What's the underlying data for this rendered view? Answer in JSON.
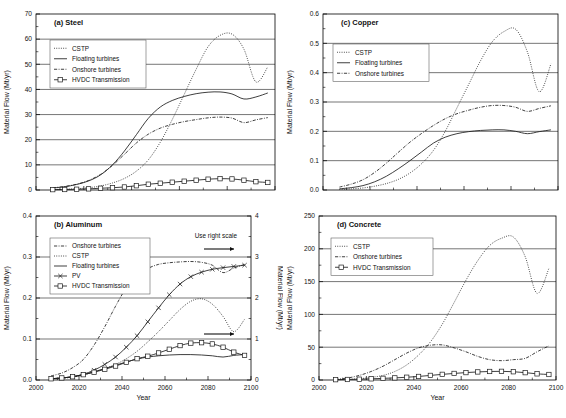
{
  "figure": {
    "width": 566,
    "height": 418,
    "background": "#ffffff",
    "line_color": "#1c1c1c",
    "grid_color": "#3b3b3b"
  },
  "chart_data": [
    {
      "id": "panel-a",
      "type": "line",
      "title": "(a)  Steel",
      "panel_letter": "(a)",
      "panel_name": "Steel",
      "xlabel": "",
      "ylabel": "Material Flow (Mt/yr)",
      "xlim": [
        2000,
        2100
      ],
      "ylim": [
        0,
        70
      ],
      "xticks": [
        2000,
        2020,
        2040,
        2060,
        2080,
        2100
      ],
      "yticks": [
        0,
        10,
        20,
        30,
        40,
        50,
        60,
        70
      ],
      "ytick_labels": [
        "0",
        "10",
        "20",
        "30",
        "40",
        "50",
        "60",
        "70"
      ],
      "xtick_labels": [
        "",
        "",
        "",
        "",
        "",
        ""
      ],
      "grid": "horizontal",
      "legend_position": "upper-left",
      "x": [
        2007,
        2012,
        2017,
        2022,
        2027,
        2032,
        2037,
        2042,
        2047,
        2052,
        2057,
        2062,
        2067,
        2072,
        2077,
        2082,
        2087,
        2092,
        2097
      ],
      "series": [
        {
          "name": "CSTP",
          "style": "dotted",
          "marker": "none",
          "values": [
            0.2,
            0.3,
            0.5,
            0.9,
            1.6,
            2.8,
            4.6,
            7.5,
            12.0,
            19.0,
            28.0,
            38.0,
            48.0,
            57.0,
            61.5,
            62.0,
            56.0,
            43.0,
            49.0
          ]
        },
        {
          "name": "Floating turbines",
          "style": "solid",
          "marker": "none",
          "values": [
            0.8,
            1.3,
            2.2,
            3.6,
            6.0,
            10.0,
            15.5,
            22.0,
            28.5,
            33.0,
            35.6,
            37.2,
            38.3,
            38.9,
            39.0,
            38.2,
            36.2,
            37.0,
            38.6
          ]
        },
        {
          "name": "Onshore turbines",
          "style": "dash-dot",
          "marker": "none",
          "values": [
            0.9,
            1.4,
            2.3,
            3.8,
            6.2,
            9.8,
            14.2,
            18.7,
            22.2,
            24.6,
            26.1,
            27.2,
            28.0,
            28.7,
            29.0,
            28.6,
            26.8,
            27.9,
            28.8
          ]
        },
        {
          "name": "HVDC Transmission",
          "style": "solid-marker",
          "marker": "square",
          "values": [
            0.15,
            0.2,
            0.3,
            0.45,
            0.7,
            0.9,
            1.2,
            1.7,
            2.3,
            2.7,
            3.1,
            3.5,
            3.9,
            4.3,
            4.5,
            4.4,
            3.9,
            3.3,
            3.0
          ]
        }
      ]
    },
    {
      "id": "panel-b",
      "type": "line",
      "title": "(b)  Aluminum",
      "panel_letter": "(b)",
      "panel_name": "Aluminum",
      "xlabel": "Year",
      "ylabel": "Material Flow (Mt/yr)",
      "ylabel_right": "Material Flow (Mt/yr)",
      "xlim": [
        2000,
        2100
      ],
      "ylim": [
        0.0,
        0.4
      ],
      "ylim_right": [
        0,
        4
      ],
      "xticks": [
        2000,
        2020,
        2040,
        2060,
        2080,
        2100
      ],
      "xtick_labels": [
        "2000",
        "2020",
        "2040",
        "2060",
        "2080",
        "2100"
      ],
      "yticks": [
        0.0,
        0.1,
        0.2,
        0.3,
        0.4
      ],
      "ytick_labels": [
        "0.0",
        "0.1",
        "0.2",
        "0.3",
        "0.4"
      ],
      "yticks_right": [
        0,
        1,
        2,
        3,
        4
      ],
      "ytick_labels_right": [
        "0",
        "1",
        "2",
        "3",
        "4"
      ],
      "grid": "horizontal",
      "legend_position": "upper-left",
      "annotation": "Use right scale",
      "x": [
        2007,
        2012,
        2017,
        2022,
        2027,
        2032,
        2037,
        2042,
        2047,
        2052,
        2057,
        2062,
        2067,
        2072,
        2077,
        2082,
        2087,
        2092,
        2097
      ],
      "series": [
        {
          "name": "Onshore turbines",
          "style": "dash-dot",
          "marker": "none",
          "axis": "right",
          "values": [
            0.1,
            0.17,
            0.3,
            0.5,
            0.85,
            1.3,
            1.8,
            2.25,
            2.55,
            2.72,
            2.82,
            2.86,
            2.88,
            2.89,
            2.87,
            2.8,
            2.62,
            2.73,
            2.82
          ]
        },
        {
          "name": "CSTP",
          "style": "dotted",
          "marker": "none",
          "axis": "left",
          "values": [
            0.002,
            0.004,
            0.007,
            0.012,
            0.02,
            0.028,
            0.038,
            0.052,
            0.07,
            0.093,
            0.118,
            0.145,
            0.172,
            0.192,
            0.198,
            0.185,
            0.155,
            0.118,
            0.148
          ]
        },
        {
          "name": "Floating turbines",
          "style": "solid",
          "marker": "none",
          "axis": "left",
          "values": [
            0.003,
            0.005,
            0.008,
            0.013,
            0.02,
            0.028,
            0.036,
            0.044,
            0.051,
            0.056,
            0.059,
            0.061,
            0.062,
            0.062,
            0.061,
            0.059,
            0.056,
            0.06,
            0.062
          ]
        },
        {
          "name": "PV",
          "style": "solid-marker",
          "marker": "cross",
          "axis": "right",
          "values": [
            0.03,
            0.05,
            0.08,
            0.14,
            0.24,
            0.38,
            0.56,
            0.8,
            1.08,
            1.42,
            1.76,
            2.08,
            2.34,
            2.52,
            2.63,
            2.7,
            2.74,
            2.77,
            2.8
          ]
        },
        {
          "name": "HVDC Transmission",
          "style": "solid-marker",
          "marker": "square",
          "axis": "left",
          "values": [
            0.003,
            0.005,
            0.008,
            0.013,
            0.019,
            0.026,
            0.034,
            0.043,
            0.052,
            0.058,
            0.066,
            0.075,
            0.084,
            0.09,
            0.091,
            0.088,
            0.08,
            0.068,
            0.06
          ]
        }
      ]
    },
    {
      "id": "panel-c",
      "type": "line",
      "title": "(c)  Copper",
      "panel_letter": "(c)",
      "panel_name": "Copper",
      "xlabel": "",
      "ylabel": "Material Flow (Mt/yr)",
      "xlim": [
        2000,
        2100
      ],
      "ylim": [
        0.0,
        0.6
      ],
      "xticks": [
        2000,
        2020,
        2040,
        2060,
        2080,
        2100
      ],
      "xtick_labels": [
        "",
        "",
        "",
        "",
        "",
        ""
      ],
      "yticks": [
        0.0,
        0.1,
        0.2,
        0.3,
        0.4,
        0.5,
        0.6
      ],
      "ytick_labels": [
        "0.0",
        "0.1",
        "0.2",
        "0.3",
        "0.4",
        "0.5",
        "0.6"
      ],
      "grid": "horizontal",
      "legend_position": "upper-left",
      "x": [
        2007,
        2012,
        2017,
        2022,
        2027,
        2032,
        2037,
        2042,
        2047,
        2052,
        2057,
        2062,
        2067,
        2072,
        2077,
        2082,
        2087,
        2092,
        2097
      ],
      "series": [
        {
          "name": "CSTP",
          "style": "dotted",
          "marker": "none",
          "values": [
            0.002,
            0.004,
            0.007,
            0.013,
            0.022,
            0.036,
            0.058,
            0.09,
            0.135,
            0.2,
            0.28,
            0.36,
            0.44,
            0.505,
            0.54,
            0.548,
            0.47,
            0.335,
            0.43
          ]
        },
        {
          "name": "Floating turbines",
          "style": "solid",
          "marker": "none",
          "values": [
            0.004,
            0.008,
            0.015,
            0.028,
            0.047,
            0.072,
            0.1,
            0.13,
            0.16,
            0.18,
            0.192,
            0.199,
            0.203,
            0.205,
            0.205,
            0.2,
            0.192,
            0.199,
            0.205
          ]
        },
        {
          "name": "Onshore turbines",
          "style": "dash-dot",
          "marker": "none",
          "values": [
            0.01,
            0.02,
            0.035,
            0.06,
            0.092,
            0.128,
            0.163,
            0.193,
            0.22,
            0.243,
            0.26,
            0.272,
            0.282,
            0.288,
            0.288,
            0.282,
            0.268,
            0.278,
            0.287
          ]
        }
      ]
    },
    {
      "id": "panel-d",
      "type": "line",
      "title": "(d)  Concrete",
      "panel_letter": "(d)",
      "panel_name": "Concrete",
      "xlabel": "Year",
      "ylabel": "Material Flow (Mt/yr)",
      "xlim": [
        2000,
        2100
      ],
      "ylim": [
        0,
        250
      ],
      "xticks": [
        2000,
        2020,
        2040,
        2060,
        2080,
        2100
      ],
      "xtick_labels": [
        "2000",
        "2020",
        "2040",
        "2060",
        "2080",
        "2100"
      ],
      "yticks": [
        0,
        50,
        100,
        150,
        200,
        250
      ],
      "ytick_labels": [
        "0",
        "50",
        "100",
        "150",
        "200",
        "250"
      ],
      "grid": "horizontal",
      "legend_position": "upper-left",
      "x": [
        2007,
        2012,
        2017,
        2022,
        2027,
        2032,
        2037,
        2042,
        2047,
        2052,
        2057,
        2062,
        2067,
        2072,
        2077,
        2082,
        2087,
        2092,
        2097
      ],
      "series": [
        {
          "name": "CSTP",
          "style": "dotted",
          "marker": "none",
          "values": [
            0.5,
            1.0,
            2.0,
            4.0,
            7.0,
            13.0,
            23.0,
            38.0,
            58.0,
            85.0,
            118.0,
            152.0,
            182.0,
            205.0,
            216.0,
            218.0,
            188.0,
            132.0,
            170.0
          ]
        },
        {
          "name": "Onshore turbines",
          "style": "dash-dot",
          "marker": "none",
          "values": [
            1.0,
            3.0,
            7.0,
            13.0,
            21.0,
            31.0,
            41.0,
            49.0,
            53.0,
            53.5,
            49.0,
            43.0,
            36.0,
            31.0,
            29.5,
            31.0,
            33.0,
            43.0,
            52.0
          ]
        },
        {
          "name": "HVDC Transmission",
          "style": "solid-marker",
          "marker": "square",
          "values": [
            0.5,
            0.8,
            1.2,
            1.8,
            2.5,
            3.2,
            4.2,
            5.4,
            7.0,
            8.6,
            10.0,
            11.3,
            12.3,
            13.0,
            13.2,
            12.6,
            11.2,
            9.4,
            8.4
          ]
        }
      ]
    }
  ]
}
